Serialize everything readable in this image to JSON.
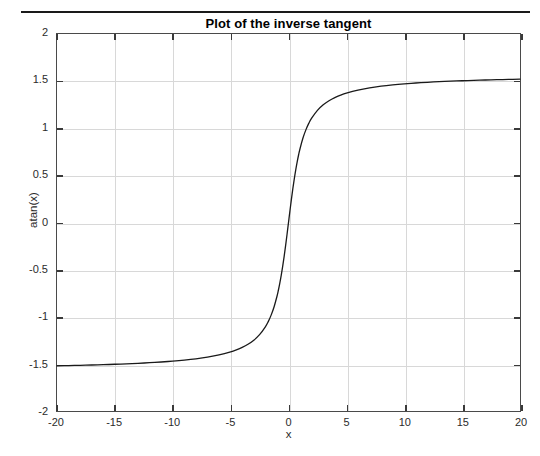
{
  "figure": {
    "divider_label": "top-rule",
    "background_color": "#ffffff",
    "axis_color": "#4a4a4a",
    "grid_color": "#d8d8d8",
    "curve_color": "#1a1a1a"
  },
  "chart_data": {
    "type": "line",
    "title": "Plot of the inverse tangent",
    "xlabel": "x",
    "ylabel": "atan(x)",
    "xlim": [
      -20,
      20
    ],
    "ylim": [
      -2,
      2
    ],
    "grid": true,
    "legend": null,
    "xticks": [
      -20,
      -15,
      -10,
      -5,
      0,
      5,
      10,
      15,
      20
    ],
    "xticklabels": [
      "-20",
      "-15",
      "-10",
      "-5",
      "0",
      "5",
      "10",
      "15",
      "20"
    ],
    "yticks": [
      2,
      1.5,
      1,
      0.5,
      0,
      -0.5,
      -1,
      -1.5,
      -2
    ],
    "yticklabels": [
      "2",
      "1.5",
      "1",
      "0.5",
      "0",
      "-0.5",
      "-1",
      "-1.5",
      "-2"
    ],
    "series": [
      {
        "name": "atan(x)",
        "color": "#1a1a1a",
        "linewidth": 1.3,
        "x": [
          -20,
          -19,
          -18,
          -17,
          -16,
          -15,
          -14,
          -13,
          -12,
          -11,
          -10,
          -9,
          -8,
          -7,
          -6,
          -5,
          -4.5,
          -4,
          -3.5,
          -3,
          -2.5,
          -2,
          -1.75,
          -1.5,
          -1.25,
          -1,
          -0.875,
          -0.75,
          -0.625,
          -0.5,
          -0.375,
          -0.25,
          -0.125,
          0,
          0.125,
          0.25,
          0.375,
          0.5,
          0.625,
          0.75,
          0.875,
          1,
          1.25,
          1.5,
          1.75,
          2,
          2.5,
          3,
          3.5,
          4,
          4.5,
          5,
          6,
          7,
          8,
          9,
          10,
          11,
          12,
          13,
          14,
          15,
          16,
          17,
          18,
          19,
          20
        ],
        "y": [
          -1.5208,
          -1.5182,
          -1.5153,
          -1.5121,
          -1.5084,
          -1.5042,
          -1.4995,
          -1.494,
          -1.4877,
          -1.4802,
          -1.4711,
          -1.4601,
          -1.4464,
          -1.4289,
          -1.4056,
          -1.3734,
          -1.3521,
          -1.3258,
          -1.2925,
          -1.249,
          -1.1903,
          -1.1071,
          -1.0517,
          -0.9828,
          -0.8961,
          -0.7854,
          -0.7188,
          -0.6435,
          -0.5586,
          -0.4636,
          -0.3588,
          -0.245,
          -0.1244,
          0,
          0.1244,
          0.245,
          0.3588,
          0.4636,
          0.5586,
          0.6435,
          0.7188,
          0.7854,
          0.8961,
          0.9828,
          1.0517,
          1.1071,
          1.1903,
          1.249,
          1.2925,
          1.3258,
          1.3521,
          1.3734,
          1.4056,
          1.4289,
          1.4464,
          1.4601,
          1.4711,
          1.4802,
          1.4877,
          1.494,
          1.4995,
          1.5042,
          1.5084,
          1.5121,
          1.5153,
          1.5182,
          1.5208
        ]
      }
    ]
  }
}
